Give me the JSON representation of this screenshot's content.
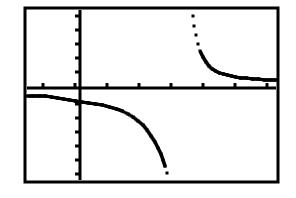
{
  "app": {
    "title": "Graphing Calculator Screen",
    "device": "graphing-calculator",
    "background_color": "#ffffff",
    "ink_color": "#000000"
  },
  "screen": {
    "frame": {
      "label": "calculator-screen-border",
      "x": 25,
      "y": 8,
      "width": 253,
      "height": 174,
      "stroke_width": 3,
      "color": "#000000"
    }
  },
  "chart_data": {
    "type": "line",
    "title": "",
    "subtitle": "",
    "xlabel": "",
    "ylabel": "",
    "grid": false,
    "legend": null,
    "legend_position": "none",
    "annotations": [],
    "axes": {
      "x_axis": {
        "label": "x-axis",
        "pixel_y": 88,
        "pixel_x_start": 27,
        "pixel_x_end": 276,
        "stroke_width": 3,
        "tick_length": 5,
        "tick_direction": "up",
        "tick_pixels_x": [
          43,
          75,
          107,
          139,
          171,
          203,
          235,
          267
        ]
      },
      "y_axis": {
        "label": "y-axis",
        "pixel_x": 80,
        "pixel_y_start": 10,
        "pixel_y_end": 180,
        "stroke_width": 3,
        "tick_length": 5,
        "tick_direction": "left",
        "tick_pixels_y": [
          16,
          30,
          44,
          58,
          72,
          104,
          118,
          132,
          146,
          160,
          174
        ]
      },
      "origin_pixel": [
        80,
        88
      ],
      "xlim": [
        -1.7,
        6.2
      ],
      "ylim": [
        -3.6,
        3.3
      ],
      "x_tick_step": 1,
      "y_tick_step": 0.5
    },
    "asymptotes": {
      "vertical_pixel_x": 180,
      "vertical_x_value": 3.1,
      "horizontal_pixel_y": 88,
      "horizontal_y_value": 0
    },
    "series": [
      {
        "name": "branch-upper-right",
        "style": "dotted-pixels",
        "points_pixel": [
          [
            193,
            16
          ],
          [
            194,
            26
          ],
          [
            196,
            35
          ],
          [
            198,
            44
          ],
          [
            200,
            51
          ],
          [
            203,
            57
          ],
          [
            206,
            62
          ],
          [
            209,
            66
          ],
          [
            212,
            69
          ],
          [
            215,
            71
          ],
          [
            219,
            73
          ],
          [
            223,
            74
          ],
          [
            227,
            75
          ],
          [
            231,
            76
          ],
          [
            235,
            77
          ],
          [
            240,
            78
          ],
          [
            246,
            78
          ],
          [
            252,
            79
          ],
          [
            258,
            79
          ],
          [
            264,
            80
          ],
          [
            270,
            80
          ],
          [
            276,
            80
          ]
        ]
      },
      {
        "name": "branch-lower-left",
        "style": "dotted-pixels",
        "points_pixel": [
          [
            27,
            96
          ],
          [
            33,
            96
          ],
          [
            39,
            96
          ],
          [
            45,
            96
          ],
          [
            51,
            97
          ],
          [
            57,
            98
          ],
          [
            63,
            99
          ],
          [
            69,
            100
          ],
          [
            75,
            101
          ],
          [
            81,
            102
          ],
          [
            88,
            103
          ],
          [
            95,
            104
          ],
          [
            102,
            105
          ],
          [
            109,
            107
          ],
          [
            116,
            109
          ],
          [
            122,
            111
          ],
          [
            128,
            114
          ],
          [
            133,
            117
          ],
          [
            138,
            121
          ],
          [
            143,
            125
          ],
          [
            147,
            130
          ],
          [
            151,
            136
          ],
          [
            155,
            142
          ],
          [
            158,
            148
          ],
          [
            161,
            154
          ],
          [
            163,
            160
          ],
          [
            165,
            166
          ],
          [
            167,
            173
          ]
        ]
      }
    ]
  }
}
